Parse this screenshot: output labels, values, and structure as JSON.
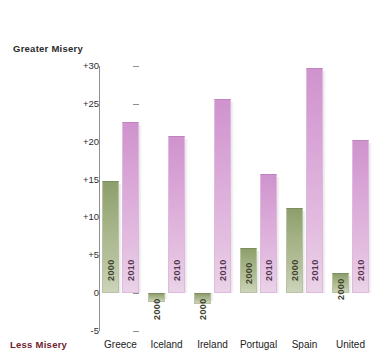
{
  "chart_data": {
    "type": "bar",
    "title": "",
    "xlabel": "",
    "ylabel": "",
    "ylim": [
      -5,
      30
    ],
    "grid": false,
    "legend_position": "in-bar",
    "axis_top_annotation": "Greater Misery",
    "axis_bottom_annotation": "Less Misery",
    "categories": [
      "Greece",
      "Iceland",
      "Ireland",
      "Portugal",
      "Spain",
      "United"
    ],
    "tick_labels": [
      "+30",
      "+25",
      "+20",
      "+15",
      "+10",
      "+5",
      "0",
      "-5"
    ],
    "tick_values": [
      30,
      25,
      20,
      15,
      10,
      5,
      0,
      -5
    ],
    "series": [
      {
        "name": "2000",
        "color": "#9fae80",
        "values": [
          14.8,
          -1.2,
          -1.4,
          5.9,
          11.3,
          2.7
        ]
      },
      {
        "name": "2010",
        "color": "#d8a4d6",
        "values": [
          22.6,
          20.8,
          25.7,
          15.8,
          29.7,
          20.2
        ]
      }
    ]
  },
  "colors": {
    "series_2000": "#9fae80",
    "series_2010": "#d8a4d6",
    "axis": "#8f8f8f",
    "top_annotation_text": "#2b2b2b",
    "bottom_annotation_text": "#6e2230",
    "background": "#ffffff"
  }
}
